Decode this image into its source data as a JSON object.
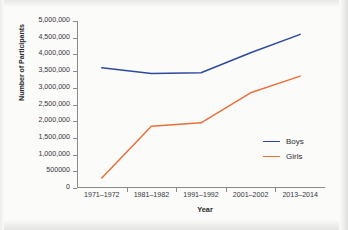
{
  "chart_data": {
    "type": "line",
    "title": "",
    "xlabel": "Year",
    "ylabel": "Number of Participants",
    "categories": [
      "1971–1972",
      "1981–1982",
      "1991–1992",
      "2001–2002",
      "2013–2014"
    ],
    "ylim": [
      0,
      5000000
    ],
    "ytick_values": [
      0,
      500000,
      1000000,
      1500000,
      2000000,
      2500000,
      3000000,
      3500000,
      4000000,
      4500000,
      5000000
    ],
    "ytick_labels": [
      "0",
      "500000",
      "1,000,000",
      "1,500,000",
      "2,000,000",
      "2,500,000",
      "3,000,000",
      "3,500,000",
      "4,000,000",
      "4,500,000",
      "5,000,000"
    ],
    "grid": false,
    "legend_position": "inside lower-right",
    "series": [
      {
        "name": "Boys",
        "color": "#2e4a9e",
        "values": [
          3600000,
          3430000,
          3450000,
          4050000,
          4600000
        ]
      },
      {
        "name": "Girls",
        "color": "#e8703a",
        "values": [
          300000,
          1850000,
          1950000,
          2850000,
          3350000
        ]
      }
    ]
  },
  "legend": {
    "items": [
      {
        "label": "Boys",
        "color": "#2e4a9e"
      },
      {
        "label": "Girls",
        "color": "#e8703a"
      }
    ]
  },
  "axes": {
    "y_title": "Number of Participants",
    "x_title": "Year"
  }
}
